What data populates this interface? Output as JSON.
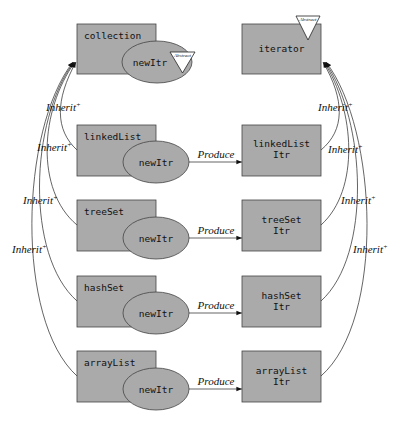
{
  "diagram": {
    "abstract_label": "Abstract",
    "inherit_label": "Inherit",
    "inherit_sup": "+",
    "produce_label": "Produce",
    "method_label": "newItr",
    "left_classes": [
      {
        "name": "collection",
        "abstract": true
      },
      {
        "name": "linkedList"
      },
      {
        "name": "treeSet"
      },
      {
        "name": "hashSet"
      },
      {
        "name": "arrayList"
      }
    ],
    "right_classes": [
      {
        "line1": "iterator",
        "line2": "",
        "abstract": true
      },
      {
        "line1": "linkedList",
        "line2": "Itr"
      },
      {
        "line1": "treeSet",
        "line2": "Itr"
      },
      {
        "line1": "hashSet",
        "line2": "Itr"
      },
      {
        "line1": "arrayList",
        "line2": "Itr"
      }
    ],
    "produces": [
      {
        "from": "linkedList.newItr",
        "to": "linkedListItr"
      },
      {
        "from": "treeSet.newItr",
        "to": "treeSetItr"
      },
      {
        "from": "hashSet.newItr",
        "to": "hashSetItr"
      },
      {
        "from": "arrayList.newItr",
        "to": "arrayListItr"
      }
    ],
    "inherits_left": [
      {
        "from": "linkedList",
        "to": "collection"
      },
      {
        "from": "treeSet",
        "to": "collection"
      },
      {
        "from": "hashSet",
        "to": "collection"
      },
      {
        "from": "arrayList",
        "to": "collection"
      }
    ],
    "inherits_right": [
      {
        "from": "linkedListItr",
        "to": "iterator"
      },
      {
        "from": "treeSetItr",
        "to": "iterator"
      },
      {
        "from": "hashSetItr",
        "to": "iterator"
      },
      {
        "from": "arrayListItr",
        "to": "iterator"
      }
    ]
  }
}
